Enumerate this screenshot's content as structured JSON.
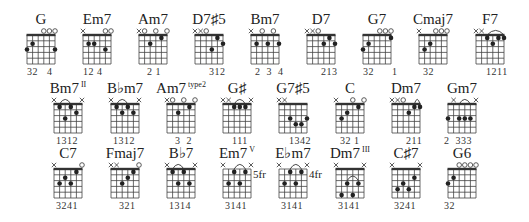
{
  "grid": {
    "strings": 6,
    "frets": 5,
    "width": 28,
    "height": 29
  },
  "rows": [
    {
      "top": 35,
      "name_y": 24,
      "finger_y": 75
    },
    {
      "top": 104,
      "name_y": 93,
      "finger_y": 144
    },
    {
      "top": 169,
      "name_y": 158,
      "finger_y": 209
    }
  ],
  "chords": [
    {
      "row": 0,
      "x": 27,
      "name": "G",
      "sup": "",
      "nut": true,
      "markers": [
        "",
        "",
        "",
        "o",
        "o",
        "o"
      ],
      "dots": [
        [
          0,
          3
        ],
        [
          1,
          2
        ],
        [
          5,
          3
        ]
      ],
      "barre": null,
      "fret_label": "",
      "fingering": "32   4",
      "finger_offset": 0
    },
    {
      "row": 0,
      "x": 83,
      "name": "Em7",
      "sup": "",
      "nut": true,
      "markers": [
        "x",
        "",
        "",
        "",
        "o",
        "o"
      ],
      "dots": [
        [
          1,
          2
        ],
        [
          2,
          2
        ],
        [
          4,
          3
        ]
      ],
      "barre": null,
      "fret_label": "",
      "fingering": "12 4",
      "finger_offset": 0
    },
    {
      "row": 0,
      "x": 139,
      "name": "Am7",
      "sup": "",
      "nut": true,
      "markers": [
        "x",
        "o",
        "",
        "o",
        "",
        "o"
      ],
      "dots": [
        [
          2,
          2
        ],
        [
          4,
          1
        ]
      ],
      "barre": null,
      "fret_label": "",
      "fingering": "2 1",
      "finger_offset": 8
    },
    {
      "row": 0,
      "x": 195,
      "name": "D7♯5",
      "sup": "",
      "nut": true,
      "markers": [
        "x",
        "x",
        "o",
        "",
        "",
        ""
      ],
      "dots": [
        [
          3,
          3
        ],
        [
          4,
          1
        ],
        [
          5,
          2
        ]
      ],
      "barre": null,
      "fret_label": "",
      "fingering": "312",
      "finger_offset": 14
    },
    {
      "row": 0,
      "x": 251,
      "name": "Bm7",
      "sup": "",
      "nut": true,
      "markers": [
        "x",
        "",
        "o",
        "",
        "o",
        ""
      ],
      "dots": [
        [
          1,
          2
        ],
        [
          3,
          2
        ],
        [
          5,
          2
        ]
      ],
      "barre": null,
      "fret_label": "",
      "fingering": "2  3  4",
      "finger_offset": 4
    },
    {
      "row": 0,
      "x": 307,
      "name": "D7",
      "sup": "",
      "nut": true,
      "markers": [
        "x",
        "x",
        "o",
        "",
        "",
        ""
      ],
      "dots": [
        [
          3,
          2
        ],
        [
          4,
          1
        ],
        [
          5,
          2
        ]
      ],
      "barre": null,
      "fret_label": "",
      "fingering": "213",
      "finger_offset": 14
    },
    {
      "row": 0,
      "x": 363,
      "name": "G7",
      "sup": "",
      "nut": true,
      "markers": [
        "",
        "",
        "",
        "o",
        "o",
        "o"
      ],
      "dots": [
        [
          0,
          3
        ],
        [
          1,
          2
        ],
        [
          5,
          1
        ]
      ],
      "barre": null,
      "fret_label": "",
      "fingering": "32      1",
      "finger_offset": 0
    },
    {
      "row": 0,
      "x": 419,
      "name": "Cmaj7",
      "sup": "",
      "nut": true,
      "markers": [
        "x",
        "",
        "",
        "o",
        "o",
        "o"
      ],
      "dots": [
        [
          1,
          3
        ],
        [
          2,
          2
        ]
      ],
      "barre": null,
      "fret_label": "",
      "fingering": "32",
      "finger_offset": 4
    },
    {
      "row": 0,
      "x": 476,
      "name": "F7",
      "sup": "",
      "nut": true,
      "markers": [
        "x",
        "x",
        "",
        "",
        "",
        ""
      ],
      "dots": [
        [
          2,
          1
        ],
        [
          3,
          2
        ],
        [
          4,
          1
        ],
        [
          5,
          1
        ]
      ],
      "barre": [
        2,
        5
      ],
      "fret_label": "",
      "fingering": "1211",
      "finger_offset": 10
    },
    {
      "row": 1,
      "x": 54,
      "name": "Bm7",
      "sup": "II",
      "nut": true,
      "markers": [
        "x",
        "",
        "",
        "",
        "",
        "x"
      ],
      "dots": [
        [
          1,
          1
        ],
        [
          2,
          3
        ],
        [
          3,
          1
        ],
        [
          4,
          2
        ]
      ],
      "barre": [
        1,
        3
      ],
      "fret_label": "",
      "fingering": "1312",
      "finger_offset": 2
    },
    {
      "row": 1,
      "x": 111,
      "name": "B♭m7",
      "sup": "",
      "nut": true,
      "markers": [
        "x",
        "",
        "",
        "",
        "",
        "x"
      ],
      "dots": [
        [
          1,
          1
        ],
        [
          2,
          2
        ],
        [
          3,
          1
        ],
        [
          4,
          2
        ]
      ],
      "barre": [
        1,
        3
      ],
      "fret_label": "",
      "fingering": "1312",
      "finger_offset": 2
    },
    {
      "row": 1,
      "x": 167,
      "name": "Am7",
      "sup": "type2",
      "nut": true,
      "markers": [
        "x",
        "o",
        "",
        "o",
        "",
        "o"
      ],
      "dots": [
        [
          2,
          2
        ],
        [
          4,
          1
        ]
      ],
      "barre": null,
      "fret_label": "",
      "fingering": "3  2",
      "finger_offset": 8
    },
    {
      "row": 1,
      "x": 223,
      "name": "G♯",
      "sup": "",
      "nut": true,
      "markers": [
        "x",
        "x",
        "",
        "",
        "",
        "x"
      ],
      "dots": [
        [
          2,
          1
        ],
        [
          3,
          1
        ],
        [
          4,
          1
        ]
      ],
      "barre": [
        2,
        4
      ],
      "fret_label": "",
      "fingering": "111",
      "finger_offset": 9
    },
    {
      "row": 1,
      "x": 279,
      "name": "G7♯5",
      "sup": "",
      "nut": true,
      "markers": [
        "x",
        "x",
        "",
        "",
        "",
        ""
      ],
      "dots": [
        [
          2,
          3
        ],
        [
          3,
          4
        ],
        [
          4,
          4
        ],
        [
          5,
          3
        ]
      ],
      "barre": null,
      "fret_label": "",
      "fingering": "1342",
      "finger_offset": 10
    },
    {
      "row": 1,
      "x": 336,
      "name": "C",
      "sup": "",
      "nut": true,
      "markers": [
        "x",
        "",
        "",
        "o",
        "",
        "o"
      ],
      "dots": [
        [
          1,
          3
        ],
        [
          2,
          2
        ],
        [
          4,
          1
        ]
      ],
      "barre": null,
      "fret_label": "",
      "fingering": "32 1",
      "finger_offset": 4
    },
    {
      "row": 1,
      "x": 392,
      "name": "Dm7",
      "sup": "",
      "nut": true,
      "markers": [
        "x",
        "x",
        "o",
        "",
        "",
        ""
      ],
      "dots": [
        [
          3,
          2
        ],
        [
          4,
          1
        ],
        [
          5,
          1
        ]
      ],
      "barre": [
        4,
        5
      ],
      "fret_label": "",
      "fingering": "211",
      "finger_offset": 14
    },
    {
      "row": 1,
      "x": 448,
      "name": "Gm7",
      "sup": "",
      "nut": true,
      "markers": [
        "",
        "x",
        "",
        "",
        "",
        "x"
      ],
      "dots": [
        [
          0,
          3
        ],
        [
          2,
          3
        ],
        [
          3,
          3
        ],
        [
          4,
          3
        ]
      ],
      "barre": [
        2,
        4
      ],
      "fret_label": "",
      "fingering": "2  333",
      "finger_offset": -4
    },
    {
      "row": 2,
      "x": 54,
      "name": "C7",
      "sup": "",
      "nut": true,
      "markers": [
        "x",
        "",
        "",
        "",
        "",
        "o"
      ],
      "dots": [
        [
          1,
          3
        ],
        [
          2,
          2
        ],
        [
          3,
          3
        ],
        [
          4,
          1
        ]
      ],
      "barre": null,
      "fret_label": "",
      "fingering": "3241",
      "finger_offset": 2
    },
    {
      "row": 2,
      "x": 111,
      "name": "Fmaj7",
      "sup": "",
      "nut": true,
      "markers": [
        "x",
        "x",
        "",
        "",
        "",
        "o"
      ],
      "dots": [
        [
          2,
          3
        ],
        [
          3,
          2
        ],
        [
          4,
          1
        ]
      ],
      "barre": null,
      "fret_label": "",
      "fingering": "321",
      "finger_offset": 8
    },
    {
      "row": 2,
      "x": 167,
      "name": "B♭7",
      "sup": "",
      "nut": true,
      "markers": [
        "x",
        "",
        "",
        "",
        "",
        "x"
      ],
      "dots": [
        [
          1,
          1
        ],
        [
          2,
          3
        ],
        [
          3,
          1
        ],
        [
          4,
          3
        ]
      ],
      "barre": [
        1,
        3
      ],
      "fret_label": "",
      "fingering": "1314",
      "finger_offset": 2
    },
    {
      "row": 2,
      "x": 223,
      "name": "Em7",
      "sup": "V",
      "nut": false,
      "markers": [
        "x",
        "",
        "",
        "",
        "",
        "x"
      ],
      "dots": [
        [
          1,
          3
        ],
        [
          2,
          1
        ],
        [
          3,
          3
        ],
        [
          4,
          1
        ]
      ],
      "barre": [
        2,
        4
      ],
      "fret_label": "5fr",
      "fingering": "3141",
      "finger_offset": 2
    },
    {
      "row": 2,
      "x": 279,
      "name": "E♭m7",
      "sup": "",
      "nut": false,
      "markers": [
        "x",
        "",
        "",
        "",
        "",
        "x"
      ],
      "dots": [
        [
          1,
          3
        ],
        [
          2,
          1
        ],
        [
          3,
          3
        ],
        [
          4,
          1
        ]
      ],
      "barre": [
        2,
        4
      ],
      "fret_label": "4fr",
      "fingering": "3141",
      "finger_offset": 2
    },
    {
      "row": 2,
      "x": 336,
      "name": "Dm7",
      "sup": "III",
      "nut": true,
      "markers": [
        "x",
        "",
        "",
        "",
        "",
        "x"
      ],
      "dots": [
        [
          1,
          5
        ],
        [
          2,
          3
        ],
        [
          3,
          5
        ],
        [
          4,
          3
        ]
      ],
      "barre": [
        2,
        4
      ],
      "barre_fret": 3,
      "fret_label": "",
      "fingering": "3141",
      "finger_offset": 2
    },
    {
      "row": 2,
      "x": 392,
      "name": "C♯7",
      "sup": "",
      "nut": true,
      "markers": [
        "x",
        "",
        "",
        "",
        "",
        "x"
      ],
      "dots": [
        [
          1,
          4
        ],
        [
          2,
          3
        ],
        [
          3,
          4
        ],
        [
          4,
          2
        ]
      ],
      "barre": null,
      "fret_label": "",
      "fingering": "3241",
      "finger_offset": 2
    },
    {
      "row": 2,
      "x": 448,
      "name": "G6",
      "sup": "",
      "nut": true,
      "markers": [
        "",
        "",
        "o",
        "o",
        "o",
        "o"
      ],
      "dots": [
        [
          0,
          3
        ],
        [
          1,
          2
        ]
      ],
      "barre": null,
      "fret_label": "",
      "fingering": "32",
      "finger_offset": -4
    }
  ],
  "chart_data": {
    "type": "chord-diagram-sheet",
    "title": "",
    "strings": 6,
    "frets_shown": 5,
    "chords": [
      "G",
      "Em7",
      "Am7",
      "D7♯5",
      "Bm7",
      "D7",
      "G7",
      "Cmaj7",
      "F7",
      "Bm7 II",
      "B♭m7",
      "Am7 type2",
      "G♯",
      "G7♯5",
      "C",
      "Dm7",
      "Gm7",
      "C7",
      "Fmaj7",
      "B♭7",
      "Em7 V (5fr)",
      "E♭m7 (4fr)",
      "Dm7 III",
      "C♯7",
      "G6"
    ],
    "fingerings": [
      "32 4",
      "12 4",
      "2 1",
      "312",
      "2 3 4",
      "213",
      "32 1",
      "32",
      "1211",
      "1312",
      "1312",
      "3 2",
      "111",
      "1342",
      "32 1",
      "211",
      "2 333",
      "3241",
      "321",
      "1314",
      "3141",
      "3141",
      "3141",
      "3241",
      "32"
    ]
  }
}
